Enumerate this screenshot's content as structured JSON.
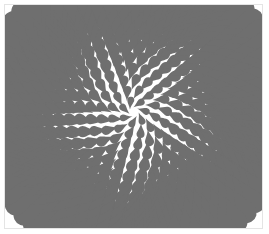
{
  "image": {
    "description": "Radial teardrop swirl pattern",
    "colors": {
      "drop": "#6f6f6f",
      "background": "#ffffff",
      "border": "#e4e4e4"
    }
  },
  "pattern": {
    "center": [
      134,
      112
    ],
    "rings": 14,
    "inner_radius": 14,
    "ring_step": 11,
    "base_count": 7,
    "count_step": 5,
    "swirl_deg": 18,
    "min_size": 3.5,
    "size_growth": 0.55
  }
}
